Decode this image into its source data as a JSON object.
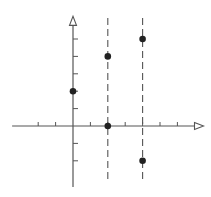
{
  "diagram": {
    "type": "coordinate-plane-plot",
    "colors": {
      "background": "#ffffff",
      "ink": "#222222",
      "axis": "#555555"
    },
    "origin_px": [
      73,
      126
    ],
    "unit_px": 17.4,
    "x_axis": {
      "from_unit": -3.5,
      "to_unit": 7.5,
      "arrow": "open-triangle",
      "ticks": [
        -2,
        -1,
        1,
        2,
        3,
        4,
        5,
        6
      ]
    },
    "y_axis": {
      "from_unit": -3.5,
      "to_unit": 6.3,
      "arrow": "open-triangle",
      "ticks": [
        -2,
        -1,
        1,
        2,
        3,
        4,
        5
      ]
    },
    "dashed_lines": [
      {
        "x": 2,
        "y_from": -3.2,
        "y_to": 6.2
      },
      {
        "x": 4,
        "y_from": -3.2,
        "y_to": 6.2
      }
    ],
    "points": [
      {
        "x": 0,
        "y": 2
      },
      {
        "x": 2,
        "y": 4
      },
      {
        "x": 2,
        "y": 0
      },
      {
        "x": 4,
        "y": 5
      },
      {
        "x": 4,
        "y": -2
      }
    ]
  }
}
